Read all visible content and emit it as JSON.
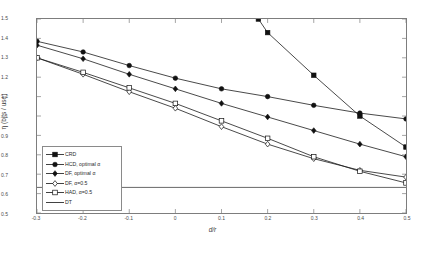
{
  "chart_data": {
    "type": "line",
    "title": "",
    "xlabel": "d/r",
    "ylabel": "η (bits / use)",
    "xlim": [
      -0.3,
      0.5
    ],
    "ylim": [
      0.5,
      1.5
    ],
    "grid": false,
    "legend_position": "lower left",
    "xticks": [
      "-0.3",
      "-0.2",
      "-0.1",
      "0",
      "0.1",
      "0.2",
      "0.3",
      "0.4",
      "0.5"
    ],
    "xtick_values": [
      -0.3,
      -0.2,
      -0.1,
      0,
      0.1,
      0.2,
      0.3,
      0.4,
      0.5
    ],
    "yticks": [
      "0.5",
      "0.6",
      "0.7",
      "0.8",
      "0.9",
      "1",
      "1.1",
      "1.2",
      "1.3",
      "1.4",
      "1.5"
    ],
    "ytick_values": [
      0.5,
      0.6,
      0.7,
      0.8,
      0.9,
      1.0,
      1.1,
      1.2,
      1.3,
      1.4,
      1.5
    ],
    "x": [
      -0.3,
      -0.2,
      -0.1,
      0,
      0.1,
      0.2,
      0.3,
      0.4,
      0.5
    ],
    "series": [
      {
        "name": "CRD",
        "marker": "square-filled",
        "line": "solid",
        "color": "#1a1a1a",
        "x": [
          0.18,
          0.2,
          0.3,
          0.4,
          0.5
        ],
        "values": [
          1.5,
          1.43,
          1.21,
          1.0,
          0.84
        ]
      },
      {
        "name": "HCD, optimal α",
        "marker": "circle-filled",
        "line": "solid",
        "color": "#1a1a1a",
        "x": [
          -0.3,
          -0.2,
          -0.1,
          0,
          0.1,
          0.2,
          0.3,
          0.4,
          0.5
        ],
        "values": [
          1.385,
          1.33,
          1.26,
          1.195,
          1.14,
          1.1,
          1.055,
          1.015,
          0.985
        ]
      },
      {
        "name": "DF, optimal α",
        "marker": "diamond-filled",
        "line": "solid",
        "color": "#1a1a1a",
        "x": [
          -0.3,
          -0.2,
          -0.1,
          0,
          0.1,
          0.2,
          0.3,
          0.4,
          0.5
        ],
        "values": [
          1.365,
          1.295,
          1.215,
          1.14,
          1.065,
          0.995,
          0.925,
          0.855,
          0.79
        ]
      },
      {
        "name": "DF, α=0.5",
        "marker": "diamond-open",
        "line": "solid",
        "color": "#1a1a1a",
        "x": [
          -0.3,
          -0.2,
          -0.1,
          0,
          0.1,
          0.2,
          0.3,
          0.4,
          0.5
        ],
        "values": [
          1.3,
          1.215,
          1.125,
          1.04,
          0.945,
          0.855,
          0.78,
          0.72,
          0.685
        ]
      },
      {
        "name": "HAD, α=0.5",
        "marker": "square-open",
        "line": "solid",
        "color": "#1a1a1a",
        "x": [
          -0.3,
          -0.2,
          -0.1,
          0,
          0.1,
          0.2,
          0.3,
          0.4,
          0.5
        ],
        "values": [
          1.3,
          1.225,
          1.145,
          1.065,
          0.975,
          0.885,
          0.79,
          0.715,
          0.655
        ]
      },
      {
        "name": "DT",
        "marker": "none",
        "line": "solid",
        "color": "#555555",
        "x": [
          -0.3,
          0.5
        ],
        "values": [
          0.632,
          0.632
        ]
      }
    ],
    "legend_entries": [
      {
        "label": "CRD",
        "marker": "square-filled"
      },
      {
        "label": "HCD, optimal α",
        "marker": "circle-filled"
      },
      {
        "label": "DF, optimal α",
        "marker": "diamond-filled"
      },
      {
        "label": "DF, α=0.5",
        "marker": "diamond-open"
      },
      {
        "label": "HAD, α=0.5",
        "marker": "square-open"
      },
      {
        "label": "DT",
        "marker": "none"
      }
    ]
  }
}
